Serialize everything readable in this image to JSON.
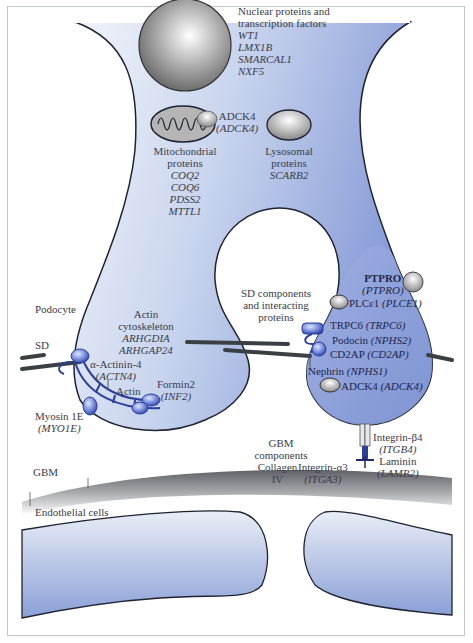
{
  "nucleus": {
    "title_line1": "Nuclear proteins and",
    "title_line2": "transcription factors",
    "genes": [
      "WT1",
      "LMX1B",
      "SMARCAL1",
      "NXF5"
    ]
  },
  "mitochondria": {
    "title_line1": "Mitochondrial",
    "title_line2": "proteins",
    "genes": [
      "COQ2",
      "COQ6",
      "PDSS2",
      "MTTL1"
    ],
    "adck4_protein": "ADCK4",
    "adck4_gene": "(ADCK4)"
  },
  "lysosome": {
    "title_line1": "Lysosomal",
    "title_line2": "proteins",
    "gene": "SCARB2"
  },
  "labels": {
    "podocyte": "Podocyte",
    "sd": "SD",
    "gbm": "GBM",
    "endothelial": "Endothelial cells"
  },
  "actin": {
    "title_line1": "Actin",
    "title_line2": "cytoskeleton",
    "genes": [
      "ARHGDIA",
      "ARHGAP24"
    ],
    "actinin_protein": "α-Actinin-4",
    "actinin_gene": "(ACTN4)",
    "actin_label": "Actin",
    "formin_protein": "Formin2",
    "formin_gene": "(INF2)",
    "myosin_protein": "Myosin 1E",
    "myosin_gene": "(MYO1E)"
  },
  "sd_components": {
    "title_line1": "SD components",
    "title_line2": "and interacting",
    "title_line3": "proteins",
    "items": [
      {
        "protein": "PTPRO",
        "gene": "(PTPRO)"
      },
      {
        "protein": "PLCε1",
        "gene": "(PLCE1)"
      },
      {
        "protein": "TRPC6",
        "gene": "(TRPC6)"
      },
      {
        "protein": "Podocin",
        "gene": "(NPHS2)"
      },
      {
        "protein": "CD2AP",
        "gene": "(CD2AP)"
      },
      {
        "protein": "Nephrin",
        "gene": "(NPHS1)"
      },
      {
        "protein": "ADCK4",
        "gene": "(ADCK4)"
      }
    ]
  },
  "gbm_components": {
    "title_line1": "GBM",
    "title_line2": "components",
    "collagen_line1": "Collagen",
    "collagen_line2": "IV",
    "integrin_a3_protein": "Integrin-α3",
    "integrin_a3_gene": "(ITGA3)",
    "integrin_b4_protein": "Integrin-β4",
    "integrin_b4_gene": "(ITGB4)",
    "laminin_protein": "Laminin",
    "laminin_gene": "(LAMB2)"
  },
  "colors": {
    "cell_light": "#e6ecf6",
    "cell_mid": "#aebfe3",
    "cell_dark": "#8196d4",
    "outline": "#1f2230",
    "protein_blue": "#2b3f9e",
    "sd_line": "#3a3f44",
    "organelle_grey": "#9a9a9a"
  }
}
